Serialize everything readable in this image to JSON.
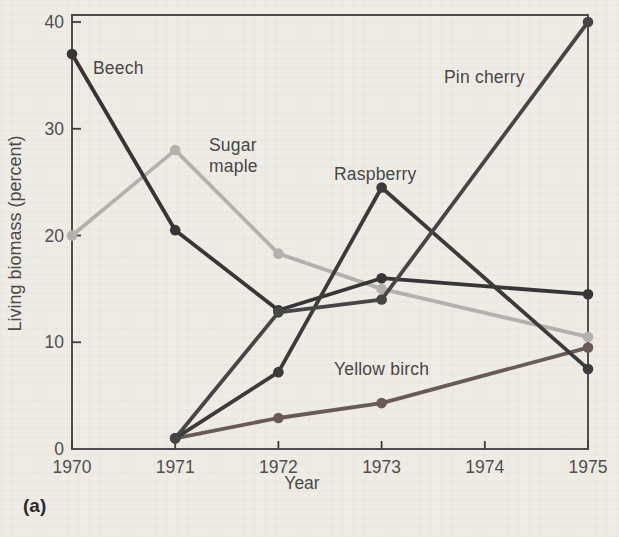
{
  "figure": {
    "panel_label": "(a)",
    "background_color": "#efece6",
    "axis_color": "#3c3c3c",
    "tick_label_color": "#4f4f4f"
  },
  "chart_data": {
    "type": "line",
    "title": "",
    "xlabel": "Year",
    "ylabel": "Living biomass (percent)",
    "xlim": [
      1970,
      1975
    ],
    "ylim": [
      0,
      40
    ],
    "x_ticks": [
      1970,
      1971,
      1972,
      1973,
      1974,
      1975
    ],
    "y_ticks": [
      0,
      10,
      20,
      30,
      40
    ],
    "grid": false,
    "legend_position": "inline-labels",
    "markers": true,
    "series": [
      {
        "name": "Sugar maple",
        "color": "#b3b1ae",
        "x": [
          1970,
          1971,
          1972,
          1973,
          1975
        ],
        "values": [
          20,
          28,
          18.3,
          15,
          10.5
        ]
      },
      {
        "name": "Yellow birch",
        "color": "#6a5a55",
        "x": [
          1971,
          1972,
          1973,
          1975
        ],
        "values": [
          1,
          2.9,
          4.3,
          9.5
        ]
      },
      {
        "name": "Beech",
        "color": "#363636",
        "x": [
          1970,
          1971,
          1972,
          1973,
          1975
        ],
        "values": [
          37,
          20.5,
          13,
          16,
          14.5
        ]
      },
      {
        "name": "Raspberry",
        "color": "#3b3b3b",
        "x": [
          1971,
          1972,
          1973,
          1975
        ],
        "values": [
          1,
          7.2,
          24.5,
          7.5
        ]
      },
      {
        "name": "Pin cherry",
        "color": "#464646",
        "x": [
          1971,
          1972,
          1973,
          1975
        ],
        "values": [
          1,
          12.8,
          14,
          40
        ]
      }
    ]
  }
}
